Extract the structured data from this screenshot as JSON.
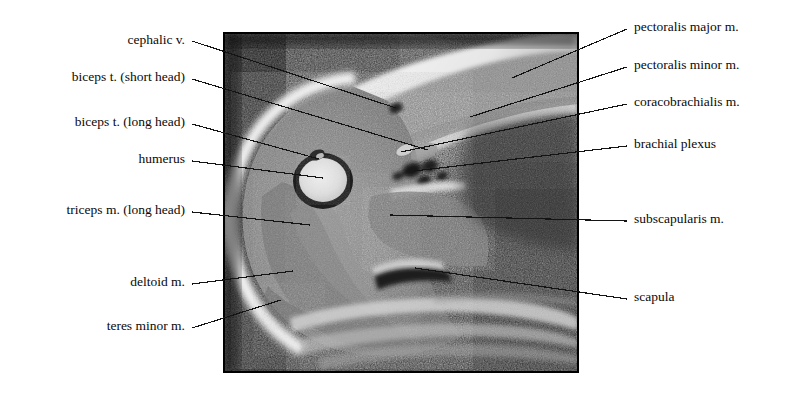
{
  "figure": {
    "kind": "annotated-mri-cross-section",
    "region": "axial section through the shoulder / proximal arm",
    "background_color": "#ffffff",
    "text_color": "#0a0a0a",
    "leader_line_color": "#141414"
  },
  "scan": {
    "frame": {
      "x": 224,
      "y": 33,
      "width": 354,
      "height": 339
    },
    "border_color": "#000000",
    "background_color": "#111111",
    "caption": ""
  },
  "labels_left": [
    {
      "id": "cephalic-vein",
      "text": "cephalic v.",
      "text_right_x": 185,
      "text_baseline_y": 46,
      "leader": {
        "x1": 192,
        "y1": 41,
        "x2": 396,
        "y2": 108
      }
    },
    {
      "id": "biceps-short-head",
      "text": "biceps t. (short head)",
      "text_right_x": 185,
      "text_baseline_y": 83,
      "leader": {
        "x1": 192,
        "y1": 79,
        "x2": 428,
        "y2": 150
      }
    },
    {
      "id": "biceps-long-head",
      "text": "biceps t. (long head)",
      "text_right_x": 185,
      "text_baseline_y": 128,
      "leader": {
        "x1": 192,
        "y1": 124,
        "x2": 319,
        "y2": 159
      }
    },
    {
      "id": "humerus",
      "text": "humerus",
      "text_right_x": 185,
      "text_baseline_y": 165,
      "leader": {
        "x1": 192,
        "y1": 161,
        "x2": 323,
        "y2": 178
      }
    },
    {
      "id": "triceps-long-head",
      "text": "triceps m. (long head)",
      "text_right_x": 185,
      "text_baseline_y": 216,
      "leader": {
        "x1": 192,
        "y1": 212,
        "x2": 310,
        "y2": 225
      }
    },
    {
      "id": "deltoid",
      "text": "deltoid m.",
      "text_right_x": 185,
      "text_baseline_y": 288,
      "leader": {
        "x1": 192,
        "y1": 284,
        "x2": 293,
        "y2": 271
      }
    },
    {
      "id": "teres-minor",
      "text": "teres minor m.",
      "text_right_x": 185,
      "text_baseline_y": 332,
      "leader": {
        "x1": 192,
        "y1": 328,
        "x2": 281,
        "y2": 300
      }
    }
  ],
  "labels_right": [
    {
      "id": "pectoralis-major",
      "text": "pectoralis major m.",
      "text_left_x": 634,
      "text_baseline_y": 33,
      "leader": {
        "x1": 627,
        "y1": 29,
        "x2": 512,
        "y2": 78
      }
    },
    {
      "id": "pectoralis-minor",
      "text": "pectoralis minor m.",
      "text_left_x": 634,
      "text_baseline_y": 71,
      "leader": {
        "x1": 627,
        "y1": 67,
        "x2": 470,
        "y2": 117
      }
    },
    {
      "id": "coracobrachialis",
      "text": "coracobrachialis m.",
      "text_left_x": 634,
      "text_baseline_y": 108,
      "leader": {
        "x1": 627,
        "y1": 104,
        "x2": 401,
        "y2": 152
      }
    },
    {
      "id": "brachial-plexus",
      "text": "brachial plexus",
      "text_left_x": 634,
      "text_baseline_y": 150,
      "leader": {
        "x1": 627,
        "y1": 146,
        "x2": 414,
        "y2": 171
      }
    },
    {
      "id": "subscapularis",
      "text": "subscapularis m.",
      "text_left_x": 634,
      "text_baseline_y": 225,
      "leader": {
        "x1": 627,
        "y1": 221,
        "x2": 390,
        "y2": 215
      }
    },
    {
      "id": "scapula",
      "text": "scapula",
      "text_left_x": 634,
      "text_baseline_y": 303,
      "leader": {
        "x1": 627,
        "y1": 299,
        "x2": 415,
        "y2": 268
      }
    }
  ],
  "anatomy_features": [
    {
      "id": "subcutaneous-fat-band",
      "tone": "bright"
    },
    {
      "id": "humeral-head-marrow",
      "tone": "very-bright"
    },
    {
      "id": "humeral-cortex",
      "tone": "dark"
    },
    {
      "id": "deltoid-muscle-belly",
      "tone": "mid-grey"
    },
    {
      "id": "chest-wall-ribs",
      "tone": "striated"
    },
    {
      "id": "axillary-fat",
      "tone": "dark"
    }
  ]
}
